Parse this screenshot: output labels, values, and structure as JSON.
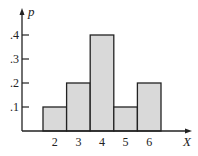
{
  "chart_data": {
    "type": "bar",
    "title": "",
    "xlabel": "X",
    "ylabel": "p",
    "categories": [
      "2",
      "3",
      "4",
      "5",
      "6"
    ],
    "values": [
      0.1,
      0.2,
      0.4,
      0.1,
      0.2
    ],
    "yticks": [
      ".1",
      ".2",
      ".3",
      ".4"
    ],
    "ylim": [
      0,
      0.45
    ],
    "grid": false,
    "legend": null,
    "bar_fill": "#d9d9d9",
    "bar_stroke": "#222222"
  }
}
